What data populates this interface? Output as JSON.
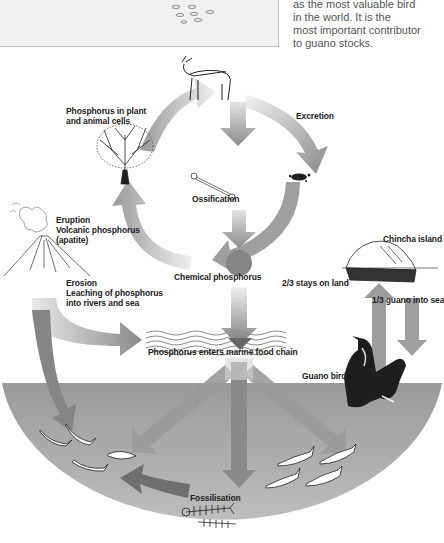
{
  "top_panel": {
    "caption_lines": [
      "as the most valuable bird",
      "in the world. It is the",
      "most important contributor",
      "to guano stocks."
    ]
  },
  "diagram": {
    "labels": {
      "plant_animal": [
        "Phosphorus in plant",
        "and animal cells"
      ],
      "excretion": "Excretion",
      "ossification": "Ossification",
      "eruption": [
        "Eruption",
        "Volcanic phosphorus",
        "(apatite)"
      ],
      "erosion": [
        "Erosion",
        "Leaching of phosphorus",
        "into rivers and sea"
      ],
      "chemical": "Chemical phosphorus",
      "chincha": "Chincha island",
      "stays_on_land": "2/3 stays on land",
      "guano_into_sea": "1/3 guano into sea",
      "marine": "Phosphorus enters marine food chain",
      "guano_bird": "Guano bird",
      "fossilisation": "Fossilisation"
    },
    "icons": [
      "deer-icon",
      "tree-icon",
      "bone-icon",
      "droppings-icon",
      "volcano-icon",
      "island-icon",
      "cormorant-icon",
      "fish-icon",
      "fish-skeleton-icon",
      "waves-icon"
    ],
    "colors": {
      "arrow_dark": "#7a7a7a",
      "arrow_light": "#d8d8d8",
      "sea_bowl": "#a4a4a4",
      "circle": "#858585",
      "text": "#222222",
      "panel_bg": "#f1f1f1"
    }
  }
}
